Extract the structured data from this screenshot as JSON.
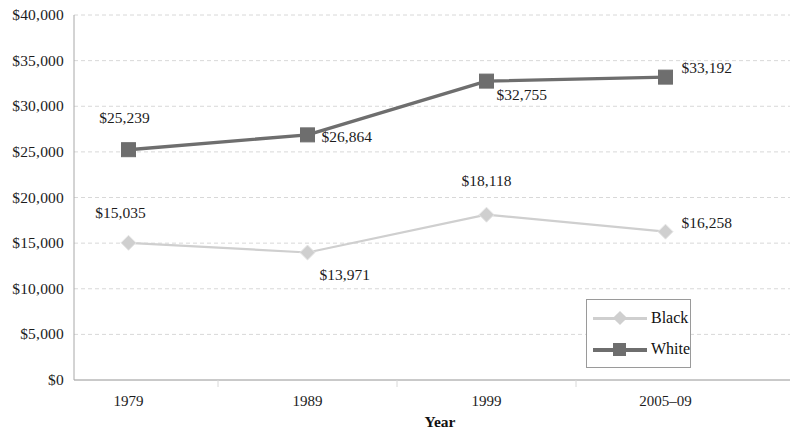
{
  "chart_data": {
    "type": "line",
    "title": "",
    "subtitle": "",
    "xlabel": "Year",
    "ylabel": "",
    "categories": [
      "1979",
      "1989",
      "1999",
      "2005–09"
    ],
    "ylim": [
      0,
      40000
    ],
    "ytick_step": 5000,
    "ytick_labels": [
      "$40,000",
      "$35,000",
      "$30,000",
      "$25,000",
      "$20,000",
      "$15,000",
      "$10,000",
      "$5,000",
      "$0"
    ],
    "ytick_values": [
      40000,
      35000,
      30000,
      25000,
      20000,
      15000,
      10000,
      5000,
      0
    ],
    "grid": true,
    "legend_position": "bottom-right",
    "series": [
      {
        "name": "Black",
        "color": "#cfcfcf",
        "marker": "diamond",
        "values": [
          15035,
          13971,
          18118,
          16258
        ],
        "value_labels": [
          "$15,035",
          "$13,971",
          "$18,118",
          "$16,258"
        ]
      },
      {
        "name": "White",
        "color": "#6e6e6e",
        "marker": "square",
        "values": [
          25239,
          26864,
          32755,
          33192
        ],
        "value_labels": [
          "$25,239",
          "$26,864",
          "$32,755",
          "$33,192"
        ]
      }
    ]
  },
  "legend": {
    "items": [
      {
        "label": "Black"
      },
      {
        "label": "White"
      }
    ]
  },
  "colors": {
    "black_series": "#cfcfcf",
    "white_series": "#6e6e6e",
    "grid": "#d8d8d8",
    "axis": "#a8a8a8",
    "text": "#1c1c1c"
  }
}
